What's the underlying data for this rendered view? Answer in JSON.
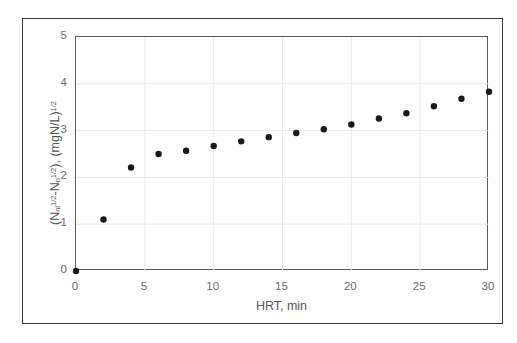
{
  "chart_data": {
    "type": "scatter",
    "title": "",
    "xlabel": "HRT, min",
    "ylabel_plain": "(N_ni^1/2 - N_n^1/2), (mgN/L)^1/2",
    "ylabel_parts": {
      "open_paren": "(",
      "var1_base": "N",
      "var1_sub": "ni",
      "var1_sup": "1/2",
      "minus": "-",
      "var2_base": "N",
      "var2_sub": "n",
      "var2_sup": "1/2",
      "close_paren": "), ",
      "unit_base": "(mgN/L)",
      "unit_sup": "1/2"
    },
    "xlim": [
      0,
      30
    ],
    "ylim": [
      0,
      5
    ],
    "xticks": [
      0,
      5,
      10,
      15,
      20,
      25,
      30
    ],
    "yticks": [
      0,
      1,
      2,
      3,
      4,
      5
    ],
    "xtick_labels": [
      "0",
      "5",
      "10",
      "15",
      "20",
      "25",
      "30"
    ],
    "ytick_labels": [
      "0",
      "1",
      "2",
      "3",
      "4",
      "5"
    ],
    "grid": true,
    "grid_color": "#e9e9e9",
    "legend": null,
    "marker": {
      "shape": "circle",
      "color": "#1a1a1a",
      "size_px": 6.4
    },
    "x": [
      0,
      2,
      4,
      6,
      8,
      10,
      12,
      14,
      16,
      18,
      20,
      22,
      24,
      26,
      28,
      30
    ],
    "values": [
      0.0,
      1.1,
      2.21,
      2.5,
      2.57,
      2.67,
      2.77,
      2.86,
      2.95,
      3.03,
      3.13,
      3.26,
      3.37,
      3.52,
      3.68,
      3.83
    ],
    "series": [
      {
        "name": "nitrogen removal",
        "points": [
          {
            "x": 0,
            "y": 0.0
          },
          {
            "x": 2,
            "y": 1.1
          },
          {
            "x": 4,
            "y": 2.21
          },
          {
            "x": 6,
            "y": 2.5
          },
          {
            "x": 8,
            "y": 2.57
          },
          {
            "x": 10,
            "y": 2.67
          },
          {
            "x": 12,
            "y": 2.77
          },
          {
            "x": 14,
            "y": 2.86
          },
          {
            "x": 16,
            "y": 2.95
          },
          {
            "x": 18,
            "y": 3.03
          },
          {
            "x": 20,
            "y": 3.13
          },
          {
            "x": 22,
            "y": 3.26
          },
          {
            "x": 24,
            "y": 3.37
          },
          {
            "x": 26,
            "y": 3.52
          },
          {
            "x": 28,
            "y": 3.68
          },
          {
            "x": 30,
            "y": 3.83
          }
        ]
      }
    ]
  }
}
